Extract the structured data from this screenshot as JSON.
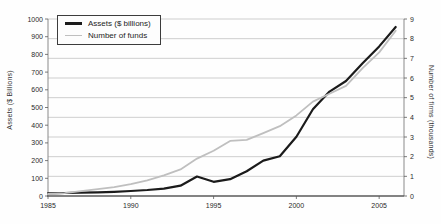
{
  "chart_data": {
    "type": "line",
    "x": [
      1985,
      1986,
      1987,
      1988,
      1989,
      1990,
      1991,
      1992,
      1993,
      1994,
      1995,
      1996,
      1997,
      1998,
      1999,
      2000,
      2001,
      2002,
      2003,
      2004,
      2005,
      2006
    ],
    "series": [
      {
        "name": "Assets ($ billions)",
        "axis": "left",
        "color": "#1b1b1b",
        "line_width": 2.2,
        "values": [
          15,
          17,
          19,
          21,
          24,
          28,
          34,
          42,
          58,
          110,
          80,
          95,
          140,
          200,
          225,
          335,
          490,
          590,
          650,
          750,
          845,
          955
        ]
      },
      {
        "name": "Number of funds",
        "axis": "right",
        "color": "#bfbfbf",
        "line_width": 1.8,
        "values": [
          0.1,
          0.15,
          0.25,
          0.35,
          0.45,
          0.6,
          0.8,
          1.05,
          1.35,
          1.9,
          2.3,
          2.8,
          2.85,
          3.2,
          3.55,
          4.1,
          4.8,
          5.2,
          5.6,
          6.5,
          7.3,
          8.4
        ]
      }
    ],
    "left_axis": {
      "label": "Assets ($ Billions)",
      "min": 0,
      "max": 1000,
      "ticks": [
        0,
        100,
        200,
        300,
        400,
        500,
        600,
        700,
        800,
        900,
        1000
      ]
    },
    "right_axis": {
      "label": "Number of firms (thousands)",
      "min": 0,
      "max": 9,
      "ticks": [
        0,
        1,
        2,
        3,
        4,
        5,
        6,
        7,
        8,
        9
      ]
    },
    "x_axis": {
      "min": 1985,
      "max": 2006.5,
      "ticks": [
        1985,
        1990,
        1995,
        2000,
        2005
      ]
    },
    "grid": "horizontal",
    "legend_position": "top-left"
  },
  "colors": {
    "background": "#fefefe",
    "gridline": "#c9c9c9",
    "axis_line": "#8a8a8a",
    "bottom_axis_line": "#5a5a5a",
    "tick_text": "#2a2a2a"
  }
}
